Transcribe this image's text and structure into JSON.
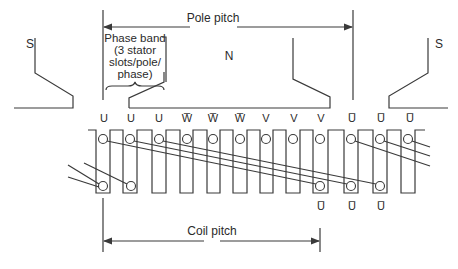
{
  "diagram": {
    "pole_pitch_label": "Pole pitch",
    "coil_pitch_label": "Coil pitch",
    "phase_band_label": [
      "Phase band",
      "(3 stator",
      "slots/pole/",
      "phase)"
    ],
    "poles": {
      "left": "S",
      "center": "N",
      "right": "S"
    },
    "slot_labels_top": [
      "U",
      "U",
      "U",
      "W̅",
      "W̅",
      "W̅",
      "V",
      "V",
      "V",
      "U̅",
      "U̅",
      "U̅"
    ],
    "slot_labels_bottom": [
      "U̅",
      "U̅",
      "U̅"
    ],
    "colors": {
      "line": "#3a3a3a",
      "text": "#2a2a2a",
      "background": "#ffffff"
    }
  }
}
